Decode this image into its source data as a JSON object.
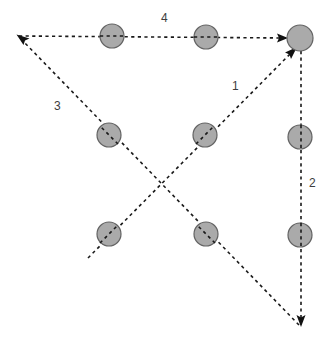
{
  "diagram": {
    "type": "directed-path-graph",
    "canvas": {
      "width": 334,
      "height": 344,
      "background": "#ffffff"
    },
    "style": {
      "node_fill": "#aaaaaa",
      "node_stroke": "#636363",
      "node_radius": 12,
      "edge_color": "#1a1a1a",
      "edge_dash": "dashed",
      "label_color": "#3d3d3d"
    },
    "nodes": [
      {
        "id": "n1",
        "name": "node-top-left",
        "cx": 112,
        "cy": 36,
        "r": 12
      },
      {
        "id": "n2",
        "name": "node-top-center",
        "cx": 206,
        "cy": 37,
        "r": 12
      },
      {
        "id": "n3",
        "name": "node-top-right",
        "cx": 300,
        "cy": 38,
        "r": 13
      },
      {
        "id": "n4",
        "name": "node-middle-left",
        "cx": 109,
        "cy": 135,
        "r": 12
      },
      {
        "id": "n5",
        "name": "node-middle-center",
        "cx": 205,
        "cy": 135,
        "r": 12
      },
      {
        "id": "n6",
        "name": "node-middle-right",
        "cx": 300,
        "cy": 137,
        "r": 12
      },
      {
        "id": "n7",
        "name": "node-bottom-left",
        "cx": 109,
        "cy": 234,
        "r": 12
      },
      {
        "id": "n8",
        "name": "node-bottom-center",
        "cx": 206,
        "cy": 234,
        "r": 12
      },
      {
        "id": "n9",
        "name": "node-bottom-right",
        "cx": 300,
        "cy": 235,
        "r": 12
      }
    ],
    "edges": [
      {
        "id": "e1",
        "label": "1",
        "name": "edge-1-up-right-diagonal",
        "from": {
          "x": 88,
          "y": 258
        },
        "to": {
          "x": 295,
          "y": 48
        },
        "arrow_at": "to",
        "label_pos": {
          "x": 232,
          "y": 80
        },
        "passes_through": [
          "n7",
          "n5"
        ]
      },
      {
        "id": "e2",
        "label": "2",
        "name": "edge-2-down-vertical",
        "from": {
          "x": 301,
          "y": 51
        },
        "to": {
          "x": 301,
          "y": 327
        },
        "arrow_at": "to",
        "label_pos": {
          "x": 309,
          "y": 177
        },
        "passes_through": [
          "n6",
          "n9"
        ]
      },
      {
        "id": "e3",
        "label": "3",
        "name": "edge-3-up-left-diagonal",
        "from": {
          "x": 299,
          "y": 325
        },
        "to": {
          "x": 17,
          "y": 36
        },
        "arrow_at": "to",
        "label_pos": {
          "x": 54,
          "y": 100
        },
        "passes_through": [
          "n8",
          "n4"
        ]
      },
      {
        "id": "e4",
        "label": "4",
        "name": "edge-4-right-horizontal",
        "from": {
          "x": 19,
          "y": 36
        },
        "to": {
          "x": 287,
          "y": 38
        },
        "arrow_at": "to",
        "label_pos": {
          "x": 161,
          "y": 12
        },
        "passes_through": [
          "n1",
          "n2"
        ]
      }
    ]
  }
}
